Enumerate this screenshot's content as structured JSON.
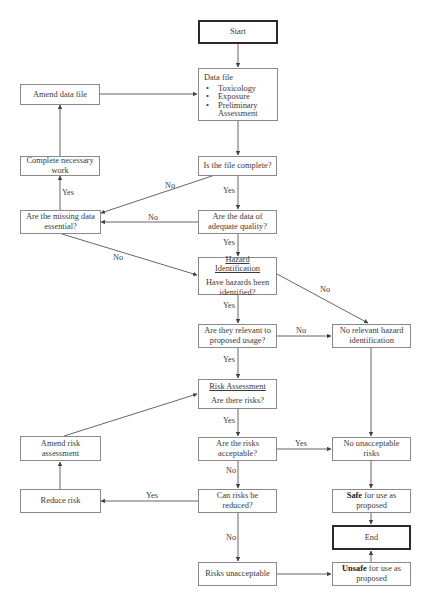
{
  "flowchart": {
    "nodes": {
      "start": {
        "label": "Start"
      },
      "data_file": {
        "title": "Data file",
        "items": [
          "Toxicology",
          "Exposure",
          "Preliminary Assessment"
        ]
      },
      "amend_data_file": {
        "label": "Amend data file"
      },
      "complete_work": {
        "label": "Complete necessary work"
      },
      "file_complete": {
        "label": "Is the file complete?"
      },
      "missing_essential": {
        "label": "Are the missing data essential?"
      },
      "adequate_quality": {
        "label": "Are the data of adequate quality?"
      },
      "hazard_id": {
        "heading": "Hazard Identification",
        "label": "Have hazards been identified?"
      },
      "relevant_usage": {
        "label": "Are they relevant to proposed usage?"
      },
      "no_relevant_hazard": {
        "label": "No relevant hazard identification"
      },
      "risk_assessment": {
        "heading": "Risk Assessment",
        "label": "Are there risks?"
      },
      "amend_risk": {
        "label": "Amend risk assessment"
      },
      "risks_acceptable": {
        "label": "Are the risks acceptable?"
      },
      "no_unacceptable": {
        "label": "No unacceptable risks"
      },
      "reduce_risk": {
        "label": "Reduce risk"
      },
      "can_reduce": {
        "label": "Can risks be reduced?"
      },
      "safe": {
        "bold": "Safe",
        "rest": " for use as proposed"
      },
      "end": {
        "label": "End"
      },
      "risks_unacceptable": {
        "label": "Risks unacceptable"
      },
      "unsafe": {
        "bold": "Unsafe",
        "rest": " for use as proposed"
      }
    },
    "edge_labels": {
      "file_complete_no": "No",
      "file_complete_yes": "Yes",
      "missing_yes": "Yes",
      "quality_no": "No",
      "quality_yes": "Yes",
      "missing_no": "No",
      "hazard_no": "No",
      "hazard_yes": "Yes",
      "relevant_no": "No",
      "relevant_yes": "Yes",
      "risks_yes": "Yes",
      "acceptable_yes": "Yes",
      "acceptable_no": "No",
      "reduce_yes": "Yes",
      "reduce_no": "No"
    },
    "colors": {
      "line": "#555555",
      "border": "#8a8a8a",
      "terminal_border": "#2a2a2a"
    }
  }
}
